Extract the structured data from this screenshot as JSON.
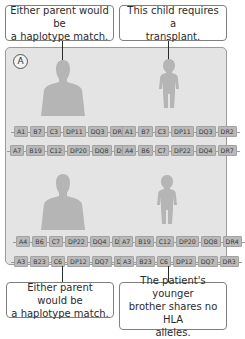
{
  "callouts": {
    "top_left": [
      "Either parent would be",
      "a haplotype match."
    ],
    "top_right": [
      "This child requires a",
      "transplant."
    ],
    "bottom_left": [
      "Either parent would be",
      "a haplotype match."
    ],
    "bottom_right": [
      "The patient's younger",
      "brother shares no HLA",
      "alleles."
    ]
  },
  "panel": {
    "label": "A"
  },
  "family": {
    "parent_top": {
      "role": "parent",
      "haplotypes": [
        [
          "A1",
          "B7",
          "C3",
          "DP11",
          "DQ3",
          "DR2"
        ],
        [
          "A7",
          "B19",
          "C12",
          "DP20",
          "DQ8",
          "DR4"
        ]
      ]
    },
    "child_patient": {
      "role": "patient",
      "haplotypes": [
        [
          "A1",
          "B7",
          "C3",
          "DP11",
          "DQ3",
          "DR2"
        ],
        [
          "A4",
          "B6",
          "C7",
          "DP22",
          "DQ4",
          "DR7"
        ]
      ]
    },
    "parent_bottom": {
      "role": "parent",
      "haplotypes": [
        [
          "A4",
          "B6",
          "C7",
          "DP22",
          "DQ4",
          "DR7"
        ],
        [
          "A3",
          "B23",
          "C6",
          "DP12",
          "DQ7",
          "DR3"
        ]
      ]
    },
    "child_brother": {
      "role": "younger brother",
      "haplotypes": [
        [
          "A7",
          "B19",
          "C12",
          "DP20",
          "DQ8",
          "DR4"
        ],
        [
          "A3",
          "B23",
          "C6",
          "DP12",
          "DQ7",
          "DR3"
        ]
      ]
    }
  },
  "colors": {
    "panel_bg": "#e4e4e4",
    "figure": "#b5b5b5",
    "allele_bg": "#b9b9b9"
  }
}
